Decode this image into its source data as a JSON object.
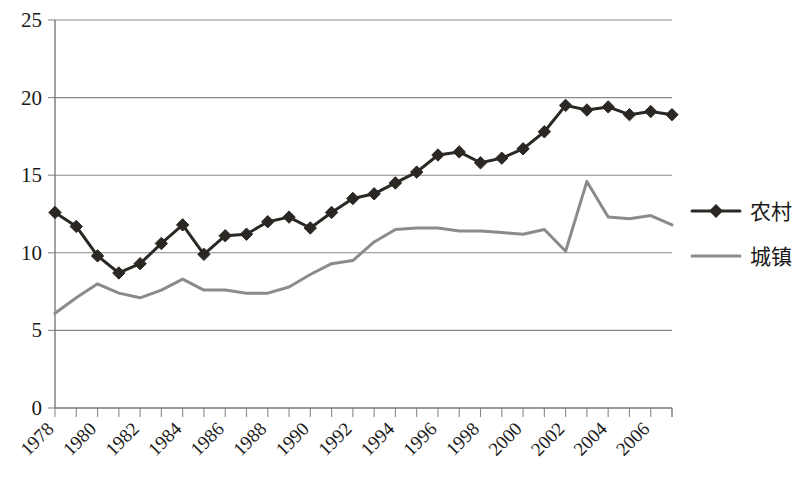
{
  "chart_data": {
    "type": "line",
    "title": "",
    "subtitle": "",
    "xlabel": "",
    "ylabel": "",
    "xlim": [
      1978,
      2007
    ],
    "ylim": [
      0,
      25
    ],
    "yticks": [
      0,
      5,
      10,
      15,
      20,
      25
    ],
    "ytick_labels": [
      "0",
      "5",
      "10",
      "15",
      "20",
      "25"
    ],
    "grid": true,
    "grid_axis": "y",
    "legend_position": "right",
    "x": [
      1978,
      1979,
      1980,
      1981,
      1982,
      1983,
      1984,
      1985,
      1986,
      1987,
      1988,
      1989,
      1990,
      1991,
      1992,
      1993,
      1994,
      1995,
      1996,
      1997,
      1998,
      1999,
      2000,
      2001,
      2002,
      2003,
      2004,
      2005,
      2006,
      2007
    ],
    "xtick_labels": [
      "1978",
      "1980",
      "1982",
      "1984",
      "1986",
      "1988",
      "1990",
      "1992",
      "1994",
      "1996",
      "1998",
      "2000",
      "2002",
      "2004",
      "2006"
    ],
    "xtick_values": [
      1978,
      1980,
      1982,
      1984,
      1986,
      1988,
      1990,
      1992,
      1994,
      1996,
      1998,
      2000,
      2002,
      2004,
      2006
    ],
    "xtick_rotation": 45,
    "series": [
      {
        "name": "农村",
        "color": "#2b2723",
        "marker": "diamond",
        "values": [
          12.6,
          11.7,
          9.8,
          8.7,
          9.3,
          10.6,
          11.8,
          9.9,
          11.1,
          11.2,
          12.0,
          12.3,
          11.6,
          12.6,
          13.5,
          13.8,
          14.5,
          15.2,
          16.3,
          16.5,
          15.8,
          16.1,
          16.7,
          17.8,
          19.5,
          19.2,
          19.4,
          18.9,
          19.1,
          18.9
        ]
      },
      {
        "name": "城镇",
        "color": "#8b8b8b",
        "marker": "none",
        "values": [
          6.1,
          7.1,
          8.0,
          7.4,
          7.1,
          7.6,
          8.3,
          7.6,
          7.6,
          7.4,
          7.4,
          7.8,
          8.6,
          9.3,
          9.5,
          10.7,
          11.5,
          11.6,
          11.6,
          11.4,
          11.4,
          11.3,
          11.2,
          11.5,
          10.1,
          14.6,
          12.3,
          12.2,
          12.4,
          11.8
        ]
      }
    ]
  },
  "legend": {
    "entries": [
      {
        "label": "农村"
      },
      {
        "label": "城镇"
      }
    ]
  },
  "colors": {
    "rural": "#2b2723",
    "urban": "#8b8b8b",
    "grid": "#888888",
    "axis": "#7a7a7a",
    "text": "#1a1a1a",
    "background": "#ffffff"
  }
}
